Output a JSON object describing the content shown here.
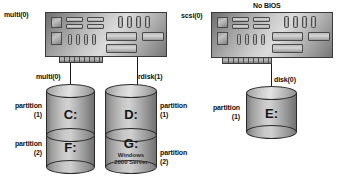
{
  "diagram": {
    "colors": {
      "text": "#101010",
      "outline": "#2b2b2b",
      "wire": "#1c1c1c",
      "metal_light": "#dcdcdc",
      "metal_dark": "#6d6d6d"
    }
  },
  "left_group": {
    "adapter_label": "multi(0)",
    "adapter_name": "ide-controller-card",
    "ports": [
      {
        "label": "multi(0)",
        "name": "port-multi-0"
      },
      {
        "label": "rdisk(1)",
        "name": "port-rdisk-1"
      }
    ],
    "disks": [
      {
        "name": "disk-c-f",
        "partitions": [
          {
            "label_line1": "partition",
            "label_line2": "(1)",
            "volume": "C:",
            "sub": ""
          },
          {
            "label_line1": "partition",
            "label_line2": "(2)",
            "volume": "F:",
            "sub": ""
          }
        ]
      },
      {
        "name": "disk-d-g",
        "partitions": [
          {
            "label_line1": "partition",
            "label_line2": "(1)",
            "volume": "D:",
            "sub": ""
          },
          {
            "label_line1": "partition",
            "label_line2": "(2)",
            "volume": "G:",
            "sub": "Windows 2000 Server"
          }
        ]
      }
    ]
  },
  "right_group": {
    "banner": "No BIOS",
    "adapter_label": "scsi(0)",
    "adapter_name": "scsi-controller-card",
    "ports": [
      {
        "label": "disk(0)",
        "name": "port-disk-0"
      }
    ],
    "disks": [
      {
        "name": "disk-e",
        "partitions": [
          {
            "label_line1": "partition",
            "label_line2": "(1)",
            "volume": "E:",
            "sub": ""
          }
        ]
      }
    ]
  }
}
